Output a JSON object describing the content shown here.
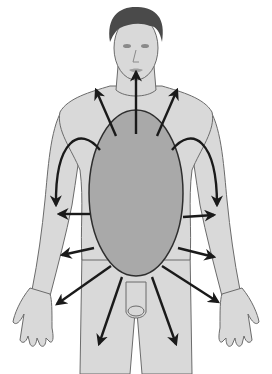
{
  "figure": {
    "colors": {
      "background": "#ffffff",
      "skin": "#d9d9d9",
      "skin_shadow": "#bcbcbc",
      "outline": "#6b6b6b",
      "hair": "#4a4a4a",
      "oval_fill": "#a9a9a9",
      "oval_stroke": "#2e2e2e",
      "arrow": "#1a1a1a"
    },
    "central_oval": {
      "cx": 136,
      "cy": 193,
      "rx": 47,
      "ry": 83
    },
    "arrows": [
      {
        "name": "arrow-up-mouth",
        "x1": 136,
        "y1": 134,
        "x2": 136,
        "y2": 72
      },
      {
        "name": "arrow-up-left-neck",
        "x1": 116,
        "y1": 136,
        "x2": 96,
        "y2": 90
      },
      {
        "name": "arrow-up-right-neck",
        "x1": 157,
        "y1": 136,
        "x2": 177,
        "y2": 90
      },
      {
        "name": "arrow-left-upper-arm",
        "x1": 90,
        "y1": 214,
        "x2": 59,
        "y2": 214
      },
      {
        "name": "arrow-left-forearm",
        "x1": 94,
        "y1": 248,
        "x2": 62,
        "y2": 255
      },
      {
        "name": "arrow-right-upper-arm",
        "x1": 183,
        "y1": 217,
        "x2": 214,
        "y2": 215
      },
      {
        "name": "arrow-right-forearm",
        "x1": 178,
        "y1": 248,
        "x2": 214,
        "y2": 257
      },
      {
        "name": "arrow-left-hand",
        "x1": 111,
        "y1": 266,
        "x2": 57,
        "y2": 304
      },
      {
        "name": "arrow-right-hand",
        "x1": 162,
        "y1": 266,
        "x2": 218,
        "y2": 302
      },
      {
        "name": "arrow-left-leg",
        "x1": 122,
        "y1": 277,
        "x2": 99,
        "y2": 344
      },
      {
        "name": "arrow-right-leg",
        "x1": 152,
        "y1": 277,
        "x2": 176,
        "y2": 344
      }
    ],
    "curved_arrows": [
      {
        "name": "arc-left-shoulder",
        "d": "M 100 150 C 80 125, 55 140, 56 205"
      },
      {
        "name": "arc-right-shoulder",
        "d": "M 172 150 C 192 125, 217 140, 217 205"
      }
    ]
  }
}
